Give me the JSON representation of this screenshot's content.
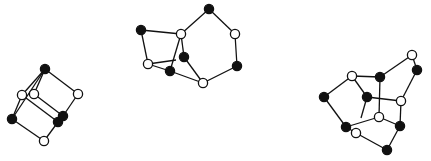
{
  "figure": {
    "width": 431,
    "height": 161,
    "background": "#ffffff",
    "colors": {
      "line": "#111111",
      "black_node": "#111111",
      "white_node": "#ffffff"
    },
    "node_radius": 4.6
  },
  "graphs": [
    {
      "name": "graph-left",
      "nodes": [
        {
          "id": "a",
          "x": 45,
          "y": 69,
          "color": "black"
        },
        {
          "id": "b",
          "x": 22,
          "y": 95,
          "color": "white"
        },
        {
          "id": "c",
          "x": 34,
          "y": 94,
          "color": "white"
        },
        {
          "id": "d",
          "x": 78,
          "y": 94,
          "color": "white"
        },
        {
          "id": "e",
          "x": 12,
          "y": 119,
          "color": "black"
        },
        {
          "id": "f",
          "x": 58,
          "y": 122,
          "color": "black"
        },
        {
          "id": "g",
          "x": 63,
          "y": 116,
          "color": "black"
        },
        {
          "id": "h",
          "x": 44,
          "y": 141,
          "color": "white"
        }
      ],
      "edges": [
        [
          "a",
          "b"
        ],
        [
          "a",
          "c"
        ],
        [
          "a",
          "d"
        ],
        [
          "a",
          "e"
        ],
        [
          "b",
          "e"
        ],
        [
          "b",
          "f"
        ],
        [
          "c",
          "g"
        ],
        [
          "d",
          "g"
        ],
        [
          "e",
          "h"
        ],
        [
          "h",
          "f"
        ],
        [
          "f",
          "g"
        ]
      ]
    },
    {
      "name": "graph-middle",
      "nodes": [
        {
          "id": "a",
          "x": 209,
          "y": 9,
          "color": "black"
        },
        {
          "id": "b",
          "x": 141,
          "y": 30,
          "color": "black"
        },
        {
          "id": "c",
          "x": 181,
          "y": 34,
          "color": "white"
        },
        {
          "id": "d",
          "x": 235,
          "y": 34,
          "color": "white"
        },
        {
          "id": "e",
          "x": 184,
          "y": 57,
          "color": "black"
        },
        {
          "id": "f",
          "x": 237,
          "y": 66,
          "color": "black"
        },
        {
          "id": "g",
          "x": 148,
          "y": 64,
          "color": "white"
        },
        {
          "id": "h",
          "x": 170,
          "y": 71,
          "color": "black"
        },
        {
          "id": "i",
          "x": 203,
          "y": 83,
          "color": "white"
        }
      ],
      "edges": [
        [
          "a",
          "c"
        ],
        [
          "a",
          "d"
        ],
        [
          "d",
          "f"
        ],
        [
          "f",
          "i"
        ],
        [
          "b",
          "c"
        ],
        [
          "b",
          "g"
        ],
        [
          "g",
          "h"
        ],
        [
          "h",
          "i"
        ],
        [
          "c",
          "h"
        ],
        [
          "c",
          "e"
        ],
        [
          "e",
          "i"
        ]
      ],
      "partial_edges": [
        {
          "from": "g",
          "to_x": 176,
          "to_y": 60
        }
      ]
    },
    {
      "name": "graph-right",
      "nodes": [
        {
          "id": "a",
          "x": 412,
          "y": 55,
          "color": "white"
        },
        {
          "id": "b",
          "x": 417,
          "y": 70,
          "color": "black"
        },
        {
          "id": "c",
          "x": 352,
          "y": 76,
          "color": "white"
        },
        {
          "id": "d",
          "x": 380,
          "y": 77,
          "color": "black"
        },
        {
          "id": "e",
          "x": 324,
          "y": 97,
          "color": "black"
        },
        {
          "id": "f",
          "x": 367,
          "y": 97,
          "color": "black"
        },
        {
          "id": "g",
          "x": 401,
          "y": 101,
          "color": "white"
        },
        {
          "id": "h",
          "x": 379,
          "y": 117,
          "color": "white"
        },
        {
          "id": "i",
          "x": 400,
          "y": 126,
          "color": "black"
        },
        {
          "id": "j",
          "x": 346,
          "y": 127,
          "color": "black"
        },
        {
          "id": "k",
          "x": 356,
          "y": 133,
          "color": "white"
        },
        {
          "id": "l",
          "x": 387,
          "y": 150,
          "color": "black"
        }
      ],
      "edges": [
        [
          "a",
          "b"
        ],
        [
          "b",
          "g"
        ],
        [
          "a",
          "d"
        ],
        [
          "d",
          "c"
        ],
        [
          "d",
          "h"
        ],
        [
          "c",
          "e"
        ],
        [
          "c",
          "f"
        ],
        [
          "e",
          "j"
        ],
        [
          "f",
          "g"
        ],
        [
          "g",
          "i"
        ],
        [
          "h",
          "j"
        ],
        [
          "h",
          "i"
        ],
        [
          "j",
          "k"
        ],
        [
          "k",
          "l"
        ],
        [
          "l",
          "i"
        ]
      ],
      "partial_edges": [
        {
          "from": "f",
          "to_x": 361,
          "to_y": 118
        }
      ]
    }
  ]
}
